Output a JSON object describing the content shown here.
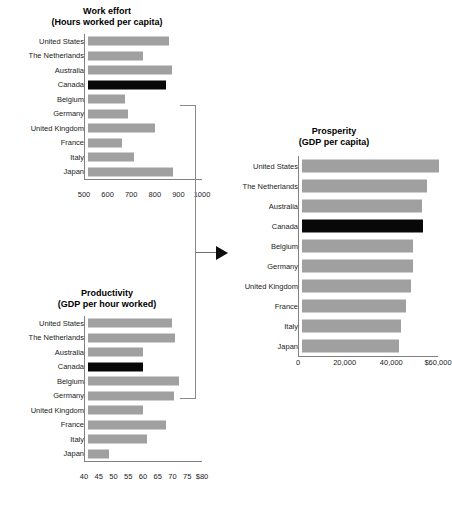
{
  "figure": {
    "background": "#ffffff",
    "bar_color": "#a0a0a0",
    "highlight_color": "#080808",
    "highlight_country": "Canada"
  },
  "connector": {
    "bracket_name": "bracket-work-effort-productivity",
    "arrow_name": "arrow-to-prosperity"
  },
  "chart_data": [
    {
      "type": "bar",
      "id": "work_effort",
      "title": "Work effort",
      "subtitle": "(Hours worked per capita)",
      "orientation": "horizontal",
      "xlabel": "",
      "ylabel": "",
      "xlim": [
        500,
        1000
      ],
      "grid": false,
      "legend": "none",
      "highlight": "Canada",
      "ticks": [
        "500",
        "600",
        "700",
        "800",
        "900",
        "1000"
      ],
      "tick_values": [
        500,
        600,
        700,
        800,
        900,
        1000
      ],
      "categories": [
        "United States",
        "The Netherlands",
        "Australia",
        "Canada",
        "Belgium",
        "Germany",
        "United Kingdom",
        "France",
        "Italy",
        "Japan"
      ],
      "values": [
        845,
        735,
        855,
        830,
        655,
        670,
        785,
        645,
        695,
        860
      ]
    },
    {
      "type": "bar",
      "id": "productivity",
      "title": "Productivity",
      "subtitle": "(GDP per hour worked)",
      "orientation": "horizontal",
      "xlabel": "",
      "ylabel": "",
      "xlim": [
        40,
        80
      ],
      "grid": false,
      "legend": "none",
      "highlight": "Canada",
      "ticks": [
        "40",
        "45",
        "50",
        "55",
        "60",
        "65",
        "70",
        "75",
        "$80"
      ],
      "tick_values": [
        40,
        45,
        50,
        55,
        60,
        65,
        70,
        75,
        80
      ],
      "categories": [
        "United States",
        "The Netherlands",
        "Australia",
        "Canada",
        "Belgium",
        "Germany",
        "United Kingdom",
        "France",
        "Italy",
        "Japan"
      ],
      "values": [
        68.5,
        69.5,
        58.5,
        58.5,
        71,
        69,
        58.5,
        66.5,
        60,
        47
      ]
    },
    {
      "type": "bar",
      "id": "prosperity",
      "title": "Prosperity",
      "subtitle": "(GDP per capita)",
      "orientation": "horizontal",
      "xlabel": "",
      "ylabel": "",
      "xlim": [
        0,
        60000
      ],
      "grid": false,
      "legend": "none",
      "highlight": "Canada",
      "ticks": [
        "0",
        "20,000",
        "40,000",
        "$60,000"
      ],
      "tick_values": [
        0,
        20000,
        40000,
        60000
      ],
      "categories": [
        "United States",
        "The Netherlands",
        "Australia",
        "Canada",
        "Belgium",
        "Germany",
        "United Kingdom",
        "France",
        "Italy",
        "Japan"
      ],
      "values": [
        58500,
        53500,
        51500,
        52000,
        47500,
        47500,
        46500,
        44500,
        42500,
        41500
      ]
    }
  ]
}
